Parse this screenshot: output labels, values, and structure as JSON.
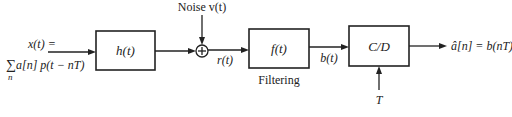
{
  "diagram": {
    "input": {
      "line1": "x(t) =",
      "line2_sum": "∑",
      "line2_sub": "n",
      "line2_expr": "a[n] p(t − nT)"
    },
    "blocks": [
      {
        "id": "h",
        "label": "h(t)"
      },
      {
        "id": "f",
        "label": "f(t)",
        "caption": "Filtering"
      },
      {
        "id": "cd",
        "label": "C/D"
      }
    ],
    "adder": {
      "symbol": "+",
      "noise_label": "Noise v(t)"
    },
    "signals": {
      "r": "r(t)",
      "b": "b(t)",
      "sampling": "T",
      "output": "â[n] = b(nT)"
    }
  }
}
